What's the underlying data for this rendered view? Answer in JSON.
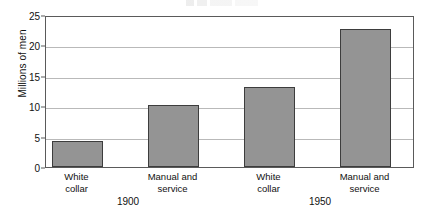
{
  "chart_data": {
    "type": "bar",
    "title": "",
    "xlabel": "",
    "ylabel": "Millions of men",
    "ylim": [
      0,
      25
    ],
    "yticks": [
      0,
      5,
      10,
      15,
      20,
      25
    ],
    "grid": true,
    "legend": "none",
    "categories": [
      "White\ncollar",
      "Manual and\nservice",
      "White\ncollar",
      "Manual and\nservice"
    ],
    "values": [
      4.3,
      10.2,
      13.1,
      22.7
    ],
    "groups": [
      {
        "label": "1900",
        "categories": [
          "White\ncollar",
          "Manual and\nservice"
        ],
        "values": [
          4.3,
          10.2
        ]
      },
      {
        "label": "1950",
        "categories": [
          "White\ncollar",
          "Manual and\nservice"
        ],
        "values": [
          13.1,
          22.7
        ]
      }
    ],
    "series": [
      {
        "name": "Millions of men",
        "values": [
          4.3,
          10.2,
          13.1,
          22.7
        ]
      }
    ],
    "colors": {
      "bar_fill": "#949494",
      "bar_edge": "#3d3d3d",
      "gridline": "#b9b9b9",
      "axis": "#5a5a5a",
      "text": "#111111",
      "background": "#ffffff"
    }
  },
  "axis": {
    "y_title": "Millions of men",
    "tick_labels": [
      "0",
      "5",
      "10",
      "15",
      "20",
      "25"
    ]
  },
  "bars": [
    {
      "name": "white-collar-1900",
      "label": "White\ncollar",
      "value": 4.3,
      "left": 51,
      "width": 51
    },
    {
      "name": "manual-and-service-1900",
      "label": "Manual and\nservice",
      "value": 10.2,
      "left": 147,
      "width": 51
    },
    {
      "name": "white-collar-1950",
      "label": "White\ncollar",
      "value": 13.1,
      "left": 243,
      "width": 51
    },
    {
      "name": "manual-and-service-1950",
      "label": "Manual and\nservice",
      "value": 22.7,
      "left": 339,
      "width": 51
    }
  ],
  "groups": [
    {
      "name": "group-1900",
      "label": "1900",
      "center": 128
    },
    {
      "name": "group-1950",
      "label": "1950",
      "center": 320
    }
  ]
}
